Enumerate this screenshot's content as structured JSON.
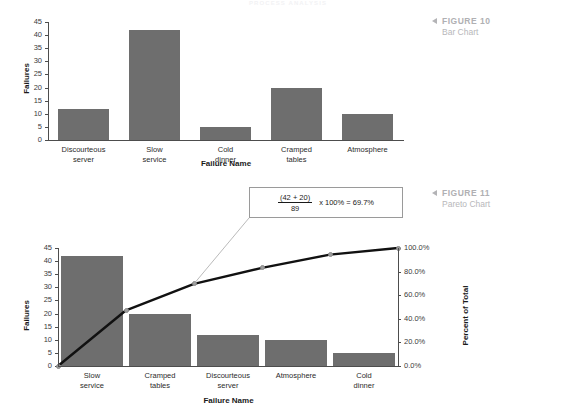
{
  "running_head": "PROCESS ANALYSIS",
  "figures": [
    {
      "marker": "◀",
      "number": "FIGURE 10",
      "title": "Bar Chart"
    },
    {
      "marker": "◀",
      "number": "FIGURE 11",
      "title": "Pareto Chart"
    }
  ],
  "callout": {
    "numerator": "(42 + 20)",
    "denominator": "89",
    "rest": "x 100% = 69.7%"
  },
  "chart_data": [
    {
      "type": "bar",
      "title": "Bar Chart",
      "xlabel": "Failure Name",
      "ylabel": "Failures",
      "categories": [
        "Discourteous\nserver",
        "Slow\nservice",
        "Cold\ndinner",
        "Cramped\ntables",
        "Atmosphere"
      ],
      "values": [
        12,
        42,
        5,
        20,
        10
      ],
      "ylim": [
        0,
        45
      ],
      "yticks": [
        0,
        5,
        10,
        15,
        20,
        25,
        30,
        35,
        40,
        45
      ],
      "ytick_labels": [
        "0",
        "5",
        "10",
        "15",
        "20",
        "25",
        "30",
        "35",
        "40",
        "45"
      ],
      "grid": false,
      "legend": "none",
      "bar_color": "#6e6e6e",
      "total": 89
    },
    {
      "type": "bar",
      "title": "Pareto Chart",
      "xlabel": "Failure Name",
      "ylabel": "Failures",
      "y2label": "Percent of Total",
      "categories": [
        "Slow\nservice",
        "Cramped\ntables",
        "Discourteous\nserver",
        "Atmosphere",
        "Cold\ndinner"
      ],
      "values": [
        42,
        20,
        12,
        10,
        5
      ],
      "ylim": [
        0,
        45
      ],
      "yticks": [
        0,
        5,
        10,
        15,
        20,
        25,
        30,
        35,
        40,
        45
      ],
      "ytick_labels": [
        "0",
        "5",
        "10",
        "15",
        "20",
        "25",
        "30",
        "35",
        "40",
        "45"
      ],
      "y2lim": [
        0,
        100
      ],
      "y2ticks": [
        0,
        20,
        40,
        60,
        80,
        100
      ],
      "y2tick_labels": [
        "0.0%",
        "20.0%",
        "40.0%",
        "60.0%",
        "80.0%",
        "100.0%"
      ],
      "series": [
        {
          "name": "Cumulative Percent",
          "values": [
            47.2,
            69.7,
            83.1,
            94.4,
            100.0
          ],
          "origin": 0.0
        }
      ],
      "grid": false,
      "legend": "none",
      "bar_color": "#6e6e6e",
      "line_color": "#111111",
      "marker_color": "#9d9d9d",
      "total": 89,
      "annotation": "(42 + 20) / 89 x 100% = 69.7%"
    }
  ]
}
